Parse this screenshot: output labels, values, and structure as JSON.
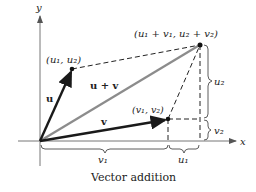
{
  "diagram": {
    "caption": "Vector addition",
    "axes": {
      "x_label": "x",
      "y_label": "y"
    },
    "points": {
      "u": "(u₁, u₂)",
      "v": "(v₁, v₂)",
      "sum": "(u₁ + v₁, u₂ + v₂)"
    },
    "vectors": {
      "u": "u",
      "v": "v",
      "sum": "u + v"
    },
    "braces": {
      "v1": "v₁",
      "u1": "u₁",
      "u2": "u₂",
      "v2": "v₂"
    },
    "colors": {
      "vector": "#1a1a1a",
      "sum_vector": "#8c8c8c",
      "axis": "#666666",
      "dash": "#222222"
    }
  }
}
